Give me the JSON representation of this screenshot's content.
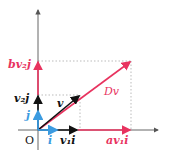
{
  "colors": {
    "basis": "#3b9be0",
    "vector": "#111111",
    "transformed": "#e8335f",
    "axis": "#555555",
    "guide": "#aaaaaa"
  },
  "labels": {
    "origin": "O",
    "i": "i",
    "j": "j",
    "v": "v",
    "v1i": "v₁i",
    "v2j": "v₂j",
    "av1i": "av₁i",
    "bv2j": "bv₂j",
    "Dv": "Dv"
  }
}
